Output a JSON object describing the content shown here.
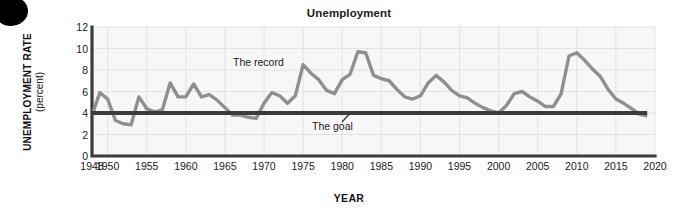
{
  "title": "Unemployment",
  "axes": {
    "y_title_main": "UNEMPLOYMENT RATE",
    "y_title_sub": "(percent)",
    "x_title": "YEAR"
  },
  "annotations": {
    "record": "The record",
    "goal": "The goal"
  },
  "colors": {
    "record_line": "#8f8f8f",
    "goal_line": "#3b3b3b",
    "axis": "#3b3b3b",
    "grid": "#e2e2e2",
    "plot_background": "#f7f7f7",
    "text": "#1a1a1a"
  },
  "chart_data": {
    "type": "line",
    "title": "Unemployment",
    "xlabel": "YEAR",
    "ylabel": "UNEMPLOYMENT RATE (percent)",
    "xlim": [
      1948,
      2020
    ],
    "ylim": [
      0,
      12
    ],
    "grid": true,
    "legend_position": "none",
    "ytick_labels": [
      "0",
      "2",
      "4",
      "6",
      "8",
      "10",
      "12"
    ],
    "ytick_values": [
      0,
      2,
      4,
      6,
      8,
      10,
      12
    ],
    "xtick_labels": [
      "1948",
      "1950",
      "1955",
      "1960",
      "1965",
      "1970",
      "1975",
      "1980",
      "1985",
      "1990",
      "1995",
      "2000",
      "2005",
      "2010",
      "2015",
      "2020"
    ],
    "xtick_values": [
      1948,
      1950,
      1955,
      1960,
      1965,
      1970,
      1975,
      1980,
      1985,
      1990,
      1995,
      2000,
      2005,
      2010,
      2015,
      2020
    ],
    "series": [
      {
        "name": "The record",
        "style": "line",
        "color": "#8f8f8f",
        "x": [
          1948,
          1949,
          1950,
          1951,
          1952,
          1953,
          1954,
          1955,
          1956,
          1957,
          1958,
          1959,
          1960,
          1961,
          1962,
          1963,
          1964,
          1965,
          1966,
          1967,
          1968,
          1969,
          1970,
          1971,
          1972,
          1973,
          1974,
          1975,
          1976,
          1977,
          1978,
          1979,
          1980,
          1981,
          1982,
          1983,
          1984,
          1985,
          1986,
          1987,
          1988,
          1989,
          1990,
          1991,
          1992,
          1993,
          1994,
          1995,
          1996,
          1997,
          1998,
          1999,
          2000,
          2001,
          2002,
          2003,
          2004,
          2005,
          2006,
          2007,
          2008,
          2009,
          2010,
          2011,
          2012,
          2013,
          2014,
          2015,
          2016,
          2017,
          2018,
          2019
        ],
        "y": [
          3.8,
          5.9,
          5.3,
          3.3,
          3.0,
          2.9,
          5.5,
          4.4,
          4.1,
          4.3,
          6.8,
          5.5,
          5.5,
          6.7,
          5.5,
          5.7,
          5.2,
          4.5,
          3.8,
          3.8,
          3.6,
          3.5,
          4.9,
          5.9,
          5.6,
          4.9,
          5.6,
          8.5,
          7.7,
          7.1,
          6.1,
          5.8,
          7.1,
          7.6,
          9.7,
          9.6,
          7.5,
          7.2,
          7.0,
          6.2,
          5.5,
          5.3,
          5.6,
          6.8,
          7.5,
          6.9,
          6.1,
          5.6,
          5.4,
          4.9,
          4.5,
          4.2,
          4.0,
          4.7,
          5.8,
          6.0,
          5.5,
          5.1,
          4.6,
          4.6,
          5.8,
          9.3,
          9.6,
          8.9,
          8.1,
          7.4,
          6.2,
          5.3,
          4.9,
          4.4,
          3.9,
          3.7
        ]
      },
      {
        "name": "The goal",
        "style": "line",
        "color": "#3b3b3b",
        "constant_value": 4,
        "x": [
          1948,
          2019
        ],
        "y": [
          4,
          4
        ]
      }
    ]
  }
}
